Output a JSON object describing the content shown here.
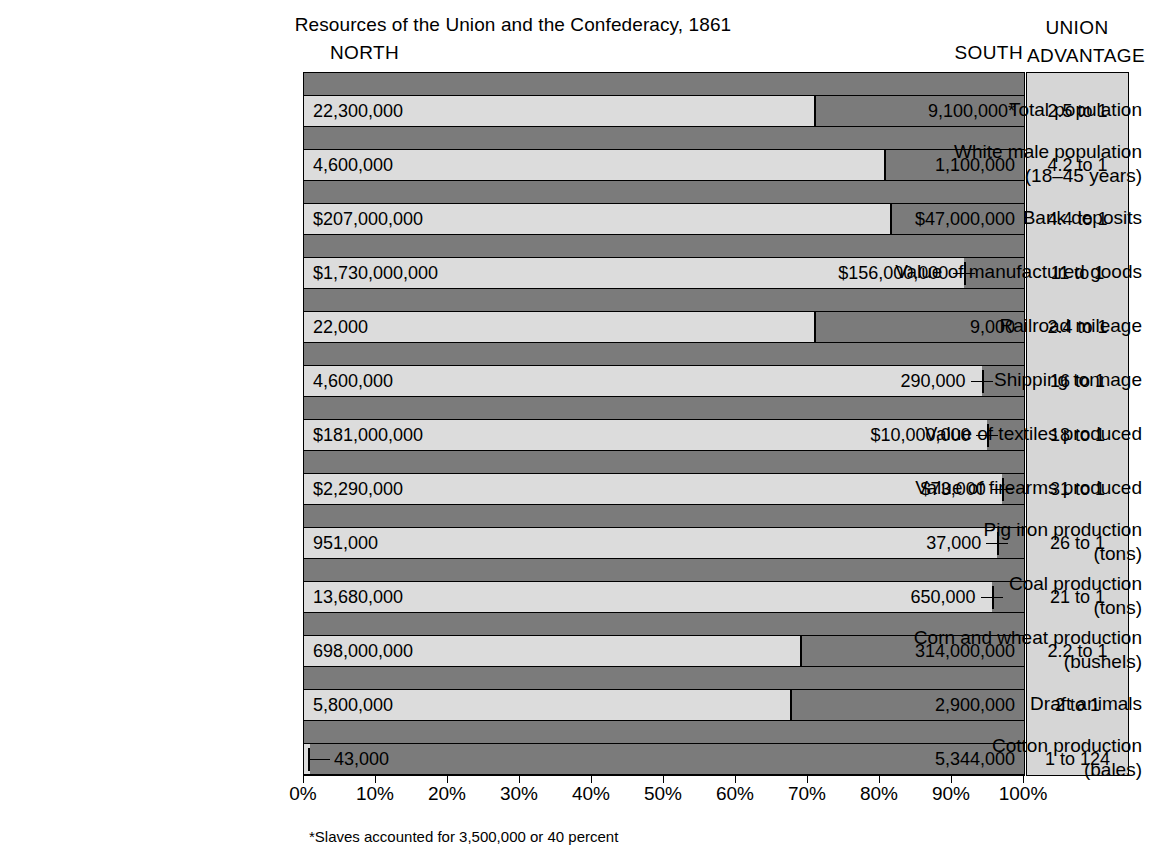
{
  "header": {
    "title": "Resources of the Union and the Confederacy, 1861",
    "north_label": "NORTH",
    "south_label": "SOUTH",
    "union_label": "UNION",
    "advantage_label": "ADVANTAGE"
  },
  "footnote": "*Slaves accounted for 3,500,000 or 40 percent",
  "colors": {
    "north_bar": "#dcdcdc",
    "south_bar": "#7b7b7b",
    "advantage_panel": "#d6d6d6",
    "outline": "#000000",
    "background": "#ffffff"
  },
  "chart_data": {
    "type": "bar",
    "title": "Resources of the Union and the Confederacy, 1861",
    "subtitle": "",
    "xlabel": "",
    "ylabel": "",
    "orientation": "horizontal",
    "stacked": true,
    "normalized": true,
    "xlim": [
      0,
      100
    ],
    "grid": false,
    "legend_position": "top",
    "axis_ticks": [
      "0%",
      "10%",
      "20%",
      "30%",
      "40%",
      "50%",
      "60%",
      "70%",
      "80%",
      "90%",
      "100%"
    ],
    "axis_tick_values": [
      0,
      10,
      20,
      30,
      40,
      50,
      60,
      70,
      80,
      90,
      100
    ],
    "series": [
      {
        "name": "NORTH",
        "color": "#dcdcdc"
      },
      {
        "name": "SOUTH",
        "color": "#7b7b7b"
      }
    ],
    "categories": [
      "Total population",
      "White male population (18–45 years)",
      "Bank deposits",
      "Value of manufactured goods",
      "Railroad mileage",
      "Shipping tonnage",
      "Value of textiles produced",
      "Value of firearms produced",
      "Pig iron production (tons)",
      "Coal production (tons)",
      "Corn and wheat production (bushels)",
      "Draft animals",
      "Cotton production (bales)"
    ],
    "rows": [
      {
        "label_line1": "Total population",
        "label_line2": "",
        "north_value": "22,300,000",
        "south_value": "9,100,000*",
        "north_pct": 71.0,
        "advantage": "2.5 to 1",
        "south_marker": "split"
      },
      {
        "label_line1": "White male population",
        "label_line2": "(18–45 years)",
        "north_value": "4,600,000",
        "south_value": "1,100,000",
        "north_pct": 80.7,
        "advantage": "4.2 to 1",
        "south_marker": "split"
      },
      {
        "label_line1": "Bank deposits",
        "label_line2": "",
        "north_value": "$207,000,000",
        "south_value": "$47,000,000",
        "north_pct": 81.5,
        "advantage": "4.4 to 1",
        "south_marker": "split"
      },
      {
        "label_line1": "Value of manufactured goods",
        "label_line2": "",
        "north_value": "$1,730,000,000",
        "south_value": "$156,000,000",
        "north_pct": 91.7,
        "advantage": "11 to 1",
        "south_marker": "tick"
      },
      {
        "label_line1": "Railroad mileage",
        "label_line2": "",
        "north_value": "22,000",
        "south_value": "9,000",
        "north_pct": 71.0,
        "advantage": "2.4 to 1",
        "south_marker": "split"
      },
      {
        "label_line1": "Shipping tonnage",
        "label_line2": "",
        "north_value": "4,600,000",
        "south_value": "290,000",
        "north_pct": 94.1,
        "advantage": "16 to 1",
        "south_marker": "tick"
      },
      {
        "label_line1": "Value of textiles produced",
        "label_line2": "",
        "north_value": "$181,000,000",
        "south_value": "$10,000,000",
        "north_pct": 94.8,
        "advantage": "18 to 1",
        "south_marker": "tick"
      },
      {
        "label_line1": "Value of firearms produced",
        "label_line2": "",
        "north_value": "$2,290,000",
        "south_value": "$73,000",
        "north_pct": 96.9,
        "advantage": "31 to 1",
        "south_marker": "tick"
      },
      {
        "label_line1": "Pig iron production",
        "label_line2": "(tons)",
        "north_value": "951,000",
        "south_value": "37,000",
        "north_pct": 96.3,
        "advantage": "26 to 1",
        "south_marker": "tick"
      },
      {
        "label_line1": "Coal production",
        "label_line2": "(tons)",
        "north_value": "13,680,000",
        "south_value": "650,000",
        "north_pct": 95.5,
        "advantage": "21 to 1",
        "south_marker": "tick"
      },
      {
        "label_line1": "Corn and wheat production",
        "label_line2": "(bushels)",
        "north_value": "698,000,000",
        "south_value": "314,000,000",
        "north_pct": 69.0,
        "advantage": "2.2 to 1",
        "south_marker": "split"
      },
      {
        "label_line1": "Draft animals",
        "label_line2": "",
        "north_value": "5,800,000",
        "south_value": "2,900,000",
        "north_pct": 67.6,
        "advantage": "2 to 1",
        "south_marker": "split"
      },
      {
        "label_line1": "Cotton production",
        "label_line2": "(bales)",
        "north_value": "43,000",
        "south_value": "5,344,000",
        "north_pct": 0.8,
        "advantage": "1 to 124",
        "south_marker": "tick-left"
      }
    ]
  }
}
